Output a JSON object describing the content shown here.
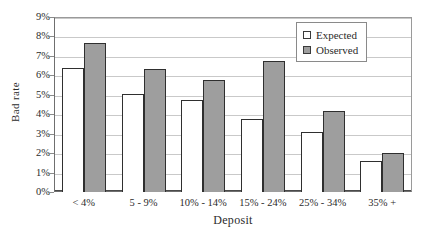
{
  "chart_data": {
    "type": "bar",
    "title": "",
    "xlabel": "Deposit",
    "ylabel": "Bad rate",
    "categories": [
      "< 4%",
      "5 - 9%",
      "10% - 14%",
      "15% - 24%",
      "25% - 34%",
      "35% +"
    ],
    "series": [
      {
        "name": "Expected",
        "values": [
          6.4,
          5.05,
          4.75,
          3.78,
          3.1,
          1.57
        ],
        "color": "#ffffff"
      },
      {
        "name": "Observed",
        "values": [
          7.65,
          6.35,
          5.75,
          6.72,
          4.15,
          2.02
        ],
        "color": "#9e9e9e"
      }
    ],
    "ylim": [
      0,
      9
    ],
    "ytick_values": [
      0,
      1,
      2,
      3,
      4,
      5,
      6,
      7,
      8,
      9
    ],
    "ytick_labels": [
      "0%",
      "1%",
      "2%",
      "3%",
      "4%",
      "5%",
      "6%",
      "7%",
      "8%",
      "9%"
    ],
    "grid": true,
    "legend_position": "top-right",
    "legend_entries": [
      "Expected",
      "Observed"
    ]
  }
}
